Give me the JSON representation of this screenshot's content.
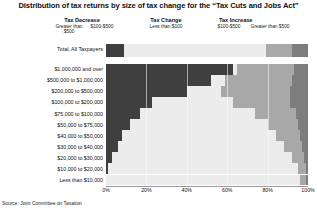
{
  "title": "Distribution of tax returns by size of tax change for the “Tax Cuts and Jobs Act”",
  "source": "Source: Joint Committee on Taxation",
  "groups": [
    {
      "name": "tax-decrease",
      "label": "Tax Decrease",
      "subs": [
        "Greater than $500",
        "$100-$500"
      ]
    },
    {
      "name": "tax-change",
      "label": "Tax Change",
      "subs": [
        "Less than $100"
      ]
    },
    {
      "name": "tax-increase",
      "label": "Tax Increase",
      "subs": [
        "$100-$500",
        "Greater than $500"
      ]
    }
  ],
  "total_row_label": "Total, All Taxpayers",
  "colors": {
    "decrease_greater_500": "#3f3f3f",
    "less_than_100": "#ececec",
    "increase_100_500": "#a8a8a8",
    "increase_greater_500": "#7d7d7d",
    "axis": "#9a9a9a",
    "text": "#111111"
  },
  "chart_data": {
    "type": "bar",
    "orientation": "horizontal",
    "stacked": true,
    "normalized_percent": true,
    "title": "Distribution of tax returns by size of tax change for the “Tax Cuts and Jobs Act”",
    "xlabel": "",
    "ylabel": "",
    "xlim": [
      0,
      100
    ],
    "xticks": [
      "0%",
      "20%",
      "40%",
      "60%",
      "80%",
      "100%"
    ],
    "xtick_values": [
      0,
      20,
      40,
      60,
      80,
      100
    ],
    "grid": false,
    "legend": "top",
    "series": [
      {
        "name": "Tax Decrease Greater than $500",
        "color": "#3f3f3f"
      },
      {
        "name": "Tax Change Less than $100",
        "color": "#ececec"
      },
      {
        "name": "Tax Increase $100-$500",
        "color": "#a8a8a8"
      },
      {
        "name": "Tax Increase Greater than $500",
        "color": "#7d7d7d"
      }
    ],
    "total_bar": {
      "category": "Total, All Taxpayers",
      "values": [
        9,
        70,
        13,
        8
      ]
    },
    "categories": [
      "$1,000,000 and over",
      "$500,000 to $1,000,000",
      "$200,000 to $500,000",
      "$100,000 to $200,000",
      "$75,000 to $100,000",
      "$50,000 to $75,000",
      "$40,000 to $50,000",
      "$30,000 to $40,000",
      "$20,000 to $30,000",
      "$10,000 to $20,000",
      "Less than $10,000"
    ],
    "values": [
      [
        63,
        2,
        28,
        7
      ],
      [
        52,
        7,
        33,
        8
      ],
      [
        40,
        17,
        34,
        9
      ],
      [
        23,
        40,
        28,
        9
      ],
      [
        17,
        57,
        20,
        6
      ],
      [
        12,
        68,
        15,
        5
      ],
      [
        8,
        76,
        12,
        4
      ],
      [
        6,
        82,
        9,
        3
      ],
      [
        3,
        89,
        6,
        2
      ],
      [
        1,
        94,
        4,
        1
      ],
      [
        0,
        96,
        3,
        1
      ]
    ]
  }
}
